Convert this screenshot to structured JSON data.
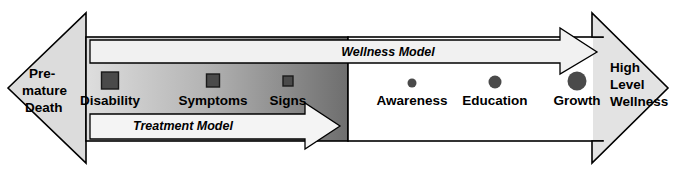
{
  "diagram": {
    "background_color": "#ffffff",
    "outline_color": "#000000",
    "left_endpoint": {
      "name": "premature-death",
      "lines": [
        "Pre-",
        "mature",
        "Death"
      ],
      "fill": "#dcdcdc",
      "direction": "left"
    },
    "right_endpoint": {
      "name": "high-level-wellness",
      "lines": [
        "High",
        "Level",
        "Wellness"
      ],
      "fill": "#e3e3e3",
      "direction": "right"
    },
    "illness_side": {
      "name": "treatment-band",
      "gradient_from": "#dedede",
      "gradient_to": "#6e6e6e",
      "marker_shape": "square",
      "marker_color": "#4a4a4a",
      "markers": [
        {
          "label": "Disability",
          "size": 17,
          "x": 110
        },
        {
          "label": "Symptoms",
          "size": 13,
          "x": 213
        },
        {
          "label": "Signs",
          "size": 10,
          "x": 288
        }
      ]
    },
    "wellness_side": {
      "name": "wellness-band",
      "fill": "#ffffff",
      "marker_shape": "circle",
      "marker_color": "#4a4a4a",
      "markers": [
        {
          "label": "Awareness",
          "size": 9,
          "x": 412
        },
        {
          "label": "Education",
          "size": 13,
          "x": 495
        },
        {
          "label": "Growth",
          "size": 19,
          "x": 577
        }
      ]
    },
    "arrows": [
      {
        "name": "wellness-model-arrow",
        "label": "Wellness Model",
        "fill": "#f1f1f1",
        "direction": "right",
        "label_x": 388,
        "label_y": 52
      },
      {
        "name": "treatment-model-arrow",
        "label": "Treatment Model",
        "fill": "#f4f4f4",
        "direction": "right",
        "label_x": 183,
        "label_y": 128
      }
    ]
  }
}
